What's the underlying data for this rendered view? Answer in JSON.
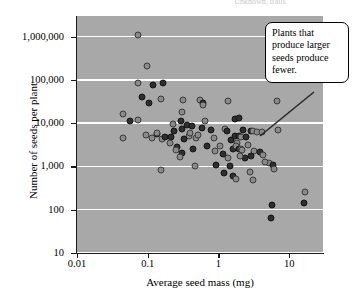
{
  "header": {
    "caption": "Unknown, trails"
  },
  "axes": {
    "x": {
      "label": "Average seed mass (mg)",
      "scale": "log",
      "ticks": [
        "0.01",
        "0.1",
        "1",
        "10"
      ],
      "tick_values": [
        0.01,
        0.1,
        1,
        10
      ],
      "lim": [
        0.01,
        30
      ]
    },
    "y": {
      "label": "Number of seeds per plant",
      "scale": "log",
      "ticks": [
        "10",
        "100",
        "1,000",
        "10,000",
        "100,000",
        "1,000,000"
      ],
      "tick_values": [
        10,
        100,
        1000,
        10000,
        100000,
        1000000
      ],
      "lim": [
        10,
        3000000
      ]
    }
  },
  "annotations": [
    {
      "name": "callout-larger-seeds-fewer",
      "text": "Plants that produce larger seeds produce fewer."
    }
  ],
  "colors": {
    "panel_background": "#a8a8a8",
    "gridline": "#ffffff",
    "marker_dark": "#2e2e2e",
    "marker_light": "#8a8a8a",
    "axis": "#1a1a1a",
    "text": "#000000"
  },
  "chart_data": {
    "type": "scatter",
    "title": "",
    "xlabel": "Average seed mass (mg)",
    "ylabel": "Number of seeds per plant",
    "xscale": "log",
    "yscale": "log",
    "xlim": [
      0.01,
      30
    ],
    "ylim": [
      10,
      3000000
    ],
    "grid": "horizontal",
    "legend": "none",
    "series": [
      {
        "name": "seed mass vs seed number",
        "n_points": 96,
        "points": [
          {
            "x": 0.073,
            "y": 1100000,
            "shade": "light"
          },
          {
            "x": 0.098,
            "y": 210000,
            "shade": "light"
          },
          {
            "x": 0.072,
            "y": 83000,
            "shade": "light"
          },
          {
            "x": 0.12,
            "y": 76000,
            "shade": "dark"
          },
          {
            "x": 0.165,
            "y": 84000,
            "shade": "dark"
          },
          {
            "x": 0.083,
            "y": 40000,
            "shade": "dark"
          },
          {
            "x": 0.105,
            "y": 30000,
            "shade": "dark"
          },
          {
            "x": 0.155,
            "y": 36000,
            "shade": "light"
          },
          {
            "x": 0.32,
            "y": 35000,
            "shade": "light"
          },
          {
            "x": 0.55,
            "y": 34000,
            "shade": "light"
          },
          {
            "x": 0.6,
            "y": 30000,
            "shade": "dark"
          },
          {
            "x": 0.6,
            "y": 27000,
            "shade": "light"
          },
          {
            "x": 1.35,
            "y": 32000,
            "shade": "light"
          },
          {
            "x": 6.8,
            "y": 32000,
            "shade": "light"
          },
          {
            "x": 0.044,
            "y": 16000,
            "shade": "light"
          },
          {
            "x": 0.3,
            "y": 18000,
            "shade": "light"
          },
          {
            "x": 0.057,
            "y": 11000,
            "shade": "dark"
          },
          {
            "x": 0.072,
            "y": 12000,
            "shade": "light"
          },
          {
            "x": 0.295,
            "y": 11500,
            "shade": "dark"
          },
          {
            "x": 0.36,
            "y": 9200,
            "shade": "dark"
          },
          {
            "x": 0.225,
            "y": 9500,
            "shade": "light"
          },
          {
            "x": 0.42,
            "y": 8400,
            "shade": "dark"
          },
          {
            "x": 0.65,
            "y": 11000,
            "shade": "light"
          },
          {
            "x": 1.72,
            "y": 12500,
            "shade": "dark"
          },
          {
            "x": 1.95,
            "y": 13500,
            "shade": "dark"
          },
          {
            "x": 0.045,
            "y": 4500,
            "shade": "light"
          },
          {
            "x": 0.095,
            "y": 5300,
            "shade": "light"
          },
          {
            "x": 0.135,
            "y": 5700,
            "shade": "dark"
          },
          {
            "x": 0.16,
            "y": 4400,
            "shade": "light"
          },
          {
            "x": 0.175,
            "y": 4700,
            "shade": "dark"
          },
          {
            "x": 0.235,
            "y": 6500,
            "shade": "dark"
          },
          {
            "x": 0.3,
            "y": 7200,
            "shade": "dark"
          },
          {
            "x": 0.38,
            "y": 5100,
            "shade": "light"
          },
          {
            "x": 0.48,
            "y": 4500,
            "shade": "light"
          },
          {
            "x": 0.78,
            "y": 7000,
            "shade": "dark"
          },
          {
            "x": 1.25,
            "y": 7500,
            "shade": "light"
          },
          {
            "x": 1.3,
            "y": 6500,
            "shade": "dark"
          },
          {
            "x": 1.72,
            "y": 5000,
            "shade": "dark"
          },
          {
            "x": 1.95,
            "y": 5000,
            "shade": "dark"
          },
          {
            "x": 2.1,
            "y": 4900,
            "shade": "light"
          },
          {
            "x": 1.85,
            "y": 3500,
            "shade": "light"
          },
          {
            "x": 2.9,
            "y": 6600,
            "shade": "dark"
          },
          {
            "x": 3.1,
            "y": 6700,
            "shade": "light"
          },
          {
            "x": 3.5,
            "y": 6400,
            "shade": "light"
          },
          {
            "x": 4.1,
            "y": 6300,
            "shade": "light"
          },
          {
            "x": 6.9,
            "y": 7000,
            "shade": "light"
          },
          {
            "x": 0.26,
            "y": 2800,
            "shade": "dark"
          },
          {
            "x": 0.3,
            "y": 2100,
            "shade": "dark"
          },
          {
            "x": 0.44,
            "y": 2500,
            "shade": "dark"
          },
          {
            "x": 0.29,
            "y": 1650,
            "shade": "light"
          },
          {
            "x": 1.15,
            "y": 1900,
            "shade": "dark"
          },
          {
            "x": 1.38,
            "y": 1600,
            "shade": "light"
          },
          {
            "x": 1.6,
            "y": 2600,
            "shade": "dark"
          },
          {
            "x": 1.75,
            "y": 3000,
            "shade": "light"
          },
          {
            "x": 1.95,
            "y": 2600,
            "shade": "dark"
          },
          {
            "x": 2.05,
            "y": 2500,
            "shade": "light"
          },
          {
            "x": 2.15,
            "y": 2400,
            "shade": "light"
          },
          {
            "x": 2.35,
            "y": 1550,
            "shade": "dark"
          },
          {
            "x": 3.2,
            "y": 2250,
            "shade": "light"
          },
          {
            "x": 3.9,
            "y": 2200,
            "shade": "dark"
          },
          {
            "x": 4.25,
            "y": 1850,
            "shade": "light"
          },
          {
            "x": 0.47,
            "y": 1050,
            "shade": "light"
          },
          {
            "x": 0.92,
            "y": 1100,
            "shade": "dark"
          },
          {
            "x": 1.45,
            "y": 1000,
            "shade": "dark"
          },
          {
            "x": 1.18,
            "y": 700,
            "shade": "dark"
          },
          {
            "x": 1.6,
            "y": 600,
            "shade": "dark"
          },
          {
            "x": 1.78,
            "y": 520,
            "shade": "light"
          },
          {
            "x": 2.75,
            "y": 750,
            "shade": "light"
          },
          {
            "x": 3.1,
            "y": 490,
            "shade": "light"
          },
          {
            "x": 5.2,
            "y": 1200,
            "shade": "light"
          },
          {
            "x": 5.9,
            "y": 1080,
            "shade": "dark"
          },
          {
            "x": 6.1,
            "y": 880,
            "shade": "light"
          },
          {
            "x": 0.155,
            "y": 850,
            "shade": "light"
          },
          {
            "x": 5.7,
            "y": 130,
            "shade": "dark"
          },
          {
            "x": 5.6,
            "y": 64,
            "shade": "dark"
          },
          {
            "x": 16.5,
            "y": 255,
            "shade": "light"
          },
          {
            "x": 16.2,
            "y": 140,
            "shade": "dark"
          },
          {
            "x": 0.21,
            "y": 4900,
            "shade": "dark"
          },
          {
            "x": 0.52,
            "y": 5200,
            "shade": "light"
          },
          {
            "x": 0.85,
            "y": 4600,
            "shade": "light"
          },
          {
            "x": 2.45,
            "y": 4800,
            "shade": "dark"
          },
          {
            "x": 0.135,
            "y": 6000,
            "shade": "light"
          },
          {
            "x": 0.58,
            "y": 7800,
            "shade": "dark"
          },
          {
            "x": 1.05,
            "y": 2900,
            "shade": "light"
          },
          {
            "x": 2.6,
            "y": 3100,
            "shade": "light"
          },
          {
            "x": 0.68,
            "y": 3000,
            "shade": "dark"
          },
          {
            "x": 0.205,
            "y": 3500,
            "shade": "light"
          },
          {
            "x": 1.5,
            "y": 4100,
            "shade": "dark"
          },
          {
            "x": 2.25,
            "y": 6900,
            "shade": "dark"
          },
          {
            "x": 0.395,
            "y": 6000,
            "shade": "light"
          },
          {
            "x": 0.33,
            "y": 4300,
            "shade": "dark"
          },
          {
            "x": 0.9,
            "y": 2300,
            "shade": "light"
          },
          {
            "x": 2.0,
            "y": 1750,
            "shade": "light"
          },
          {
            "x": 2.85,
            "y": 1700,
            "shade": "dark"
          },
          {
            "x": 4.6,
            "y": 1250,
            "shade": "light"
          },
          {
            "x": 0.115,
            "y": 4600,
            "shade": "light"
          },
          {
            "x": 0.25,
            "y": 2350,
            "shade": "light"
          }
        ]
      }
    ]
  }
}
